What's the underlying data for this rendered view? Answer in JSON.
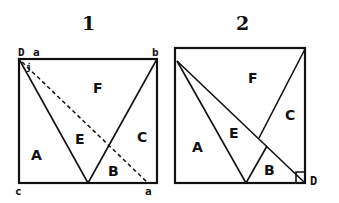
{
  "figures": [
    {
      "title": "1",
      "corner_labels": {
        "D": "D",
        "a_top": "a",
        "b": "b",
        "j": "j",
        "c": "c",
        "a_bottom": "a"
      },
      "regions": {
        "A": "A",
        "B": "B",
        "C": "C",
        "E": "E",
        "F": "F"
      }
    },
    {
      "title": "2",
      "corner_labels": {
        "D": "D"
      },
      "regions": {
        "A": "A",
        "B": "B",
        "C": "C",
        "E": "E",
        "F": "F"
      }
    }
  ]
}
